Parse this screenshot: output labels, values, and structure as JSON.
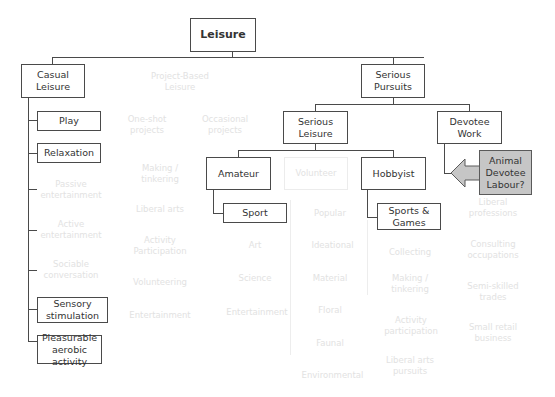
{
  "root": {
    "label": "Leisure"
  },
  "casual": {
    "label": "Casual Leisure",
    "children": [
      {
        "label": "Play",
        "highlighted": true
      },
      {
        "label": "Relaxation",
        "highlighted": true
      },
      {
        "label": "Passive entertainment",
        "highlighted": false
      },
      {
        "label": "Active entertainment",
        "highlighted": false
      },
      {
        "label": "Sociable conversation",
        "highlighted": false
      },
      {
        "label": "Sensory stimulation",
        "highlighted": true
      },
      {
        "label": "Pleasurable aerobic activity",
        "highlighted": true
      }
    ]
  },
  "project": {
    "label": "Project-Based Leisure",
    "oneshot": {
      "label": "One-shot projects",
      "children": [
        "Making / tinkering",
        "Liberal arts",
        "Activity Participation",
        "Volunteering",
        "Entertainment"
      ]
    },
    "occasional": {
      "label": "Occasional projects"
    }
  },
  "serious_pursuits": {
    "label": "Serious Pursuits"
  },
  "serious_leisure": {
    "label": "Serious Leisure"
  },
  "amateur": {
    "label": "Amateur",
    "children": [
      "Sport",
      "Art",
      "Science",
      "Entertainment"
    ]
  },
  "volunteer": {
    "label": "Volunteer",
    "children": [
      "Popular",
      "Ideational",
      "Material",
      "Floral",
      "Faunal",
      "Environmental"
    ]
  },
  "hobbyist": {
    "label": "Hobbyist",
    "children": [
      "Sports & Games",
      "Collecting",
      "Making / tinkering",
      "Activity participation",
      "Liberal arts pursuits"
    ]
  },
  "devotee": {
    "label": "Devotee Work",
    "children": [
      "Liberal professions",
      "Consulting occupations",
      "Semi-skilled trades",
      "Small retail business"
    ]
  },
  "callout": {
    "label": "Animal Devotee Labour?",
    "fill": "#c6c6c6"
  },
  "colors": {
    "line": "#4a4a4a",
    "faded": "#e2e2e2",
    "callout": "#c6c6c6"
  }
}
